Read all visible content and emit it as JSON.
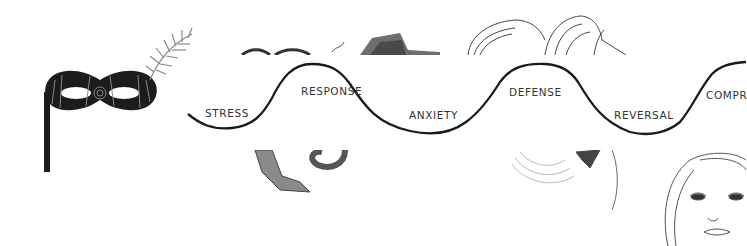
{
  "diagram": {
    "type": "wave-sequence",
    "stages": [
      {
        "label": "STRESS",
        "position": "trough"
      },
      {
        "label": "RESPONSE",
        "position": "peak"
      },
      {
        "label": "ANXIETY",
        "position": "trough"
      },
      {
        "label": "DEFENSE",
        "position": "peak"
      },
      {
        "label": "REVERSAL",
        "position": "trough"
      },
      {
        "label": "COMPR",
        "position": "peak",
        "truncated": true
      }
    ],
    "colors": {
      "line": "#1a1a1a",
      "text": "#333333",
      "background": "#ffffff"
    }
  },
  "illustrations": [
    {
      "name": "masquerade-mask-with-feather"
    },
    {
      "name": "cat-sketch"
    },
    {
      "name": "hair-sketch"
    },
    {
      "name": "woman-face-sketch"
    }
  ]
}
